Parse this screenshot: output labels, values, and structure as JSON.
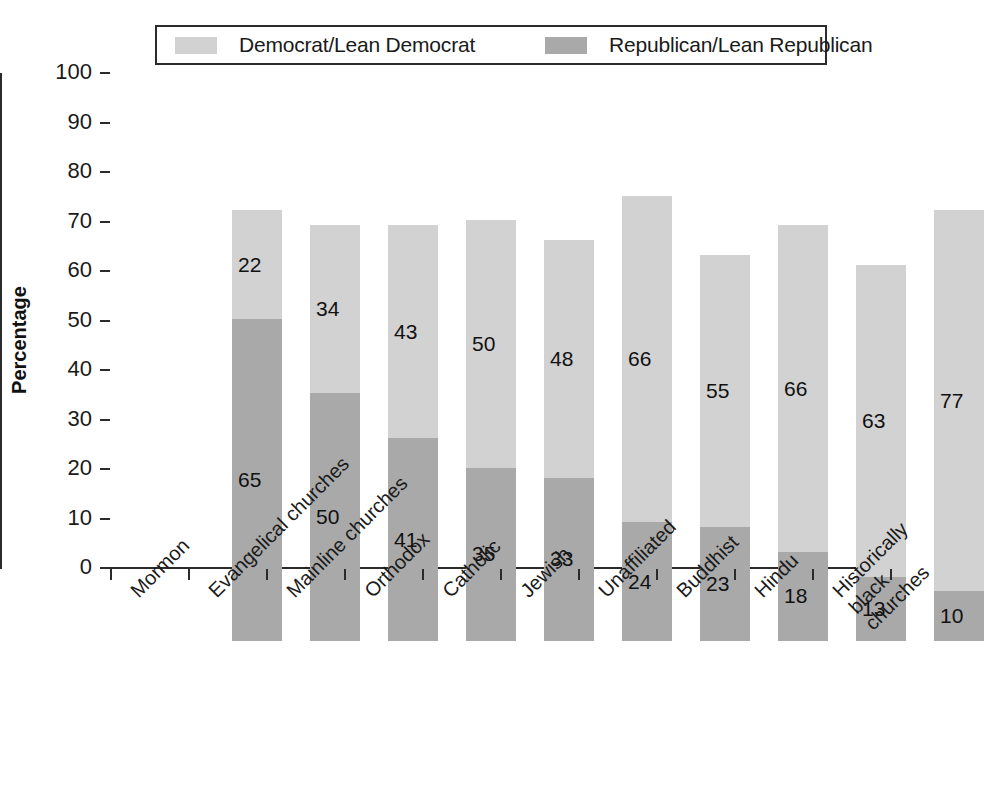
{
  "chart_data": {
    "type": "bar",
    "subtype": "stacked-vertical",
    "title": "",
    "xlabel": "",
    "ylabel": "Percentage",
    "ylim": [
      0,
      100
    ],
    "ytick_step": 10,
    "yticks": [
      100,
      90,
      80,
      70,
      60,
      50,
      40,
      30,
      20,
      10,
      0
    ],
    "grid": false,
    "legend_position": "top",
    "categories": [
      "Mormon",
      "Evangelical churches",
      "Mainline churches",
      "Orthodox",
      "Catholic",
      "Jewish",
      "Unaffiliated",
      "Buddhist",
      "Hindu",
      "Historically\nblack churches"
    ],
    "series": [
      {
        "name": "Republican/Lean Republican",
        "color": "#a9a9a9",
        "values": [
          65,
          50,
          41,
          35,
          33,
          24,
          23,
          18,
          13,
          10
        ]
      },
      {
        "name": "Democrat/Lean Democrat",
        "color": "#d2d2d2",
        "values": [
          22,
          34,
          43,
          50,
          48,
          66,
          55,
          66,
          63,
          77
        ]
      }
    ],
    "totals": [
      87,
      84,
      84,
      85,
      81,
      90,
      78,
      84,
      76,
      87
    ]
  },
  "legend": {
    "entries": [
      {
        "label": "Democrat/Lean Democrat",
        "color": "#d2d2d2",
        "swatch_name": "democrat-swatch"
      },
      {
        "label": "Republican/Lean Republican",
        "color": "#a9a9a9",
        "swatch_name": "republican-swatch"
      }
    ]
  },
  "axis": {
    "y_title": "Percentage",
    "y_tick_labels": [
      "100",
      "90",
      "80",
      "70",
      "60",
      "50",
      "40",
      "30",
      "20",
      "10",
      "0"
    ]
  }
}
